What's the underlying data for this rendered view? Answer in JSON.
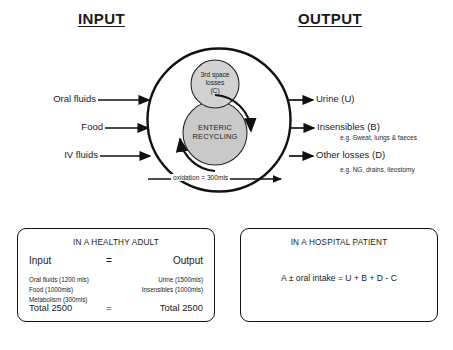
{
  "headers": {
    "input": "INPUT",
    "output": "OUTPUT"
  },
  "diagram": {
    "third_space": {
      "line1": "3rd space",
      "line2": "losses",
      "line3": "(C)"
    },
    "enteric": {
      "line1": "ENTERIC",
      "line2": "RECYCLING"
    },
    "oxidation": "oxidation = 300mls",
    "inputs": [
      {
        "label": "Oral fluids"
      },
      {
        "label": "Food"
      },
      {
        "label": "IV fluids"
      }
    ],
    "outputs": [
      {
        "label": "Urine (U)",
        "note": ""
      },
      {
        "label": "Insensibles (B)",
        "note": "e.g. Sweat, lungs & faeces"
      },
      {
        "label": "Other losses (D)",
        "note": "e.g. NG, drains, ileostomy"
      }
    ]
  },
  "panels": {
    "healthy": {
      "title": "IN A HEALTHY ADULT",
      "head_input": "Input",
      "head_equals": "=",
      "head_output": "Output",
      "input_items": [
        "Oral fluids (1200 mls)",
        "Food (1000mls)",
        "Metabolism (300mls)"
      ],
      "output_items": [
        "Urine (1500mls)",
        "Insensibles (1000mls)"
      ],
      "total_input": "Total 2500",
      "total_equals": "=",
      "total_output": "Total 2500"
    },
    "hospital": {
      "title": "IN A HOSPITAL PATIENT",
      "formula": "A ± oral intake = U + B + D - C"
    }
  },
  "colors": {
    "stroke": "#111111",
    "third_space_fill": "#d2d2d2",
    "enteric_fill": "#c9c9c9",
    "background": "#ffffff"
  }
}
